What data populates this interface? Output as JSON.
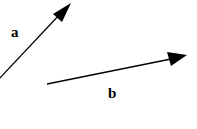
{
  "vectors": [
    {
      "label": "a",
      "color": "#000000"
    },
    {
      "label": "b",
      "color": "#000000"
    }
  ]
}
